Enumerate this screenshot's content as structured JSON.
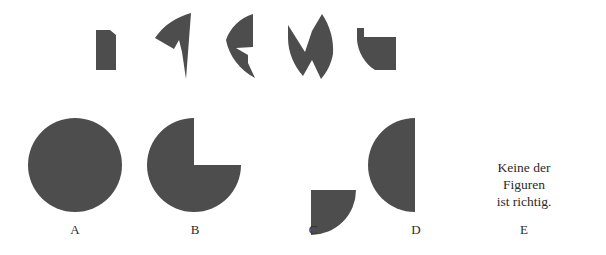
{
  "puzzle": {
    "type": "shape-assembly-visual-reasoning",
    "language": "de",
    "background_color": "#ffffff",
    "shape_fill_color": "#4d4d4d",
    "label_color": "#2b2b2b"
  },
  "fragments": {
    "caption": "",
    "count": 5,
    "items": [
      {
        "id": "fragment-1",
        "name": "notched-rectangle-piece"
      },
      {
        "id": "fragment-2",
        "name": "curved-arrow-wedge-piece"
      },
      {
        "id": "fragment-3",
        "name": "crescent-notch-piece"
      },
      {
        "id": "fragment-4",
        "name": "zigzag-double-wedge-piece"
      },
      {
        "id": "fragment-5",
        "name": "quarter-round-notched-piece"
      }
    ]
  },
  "options": {
    "count": 5,
    "items": [
      {
        "label": "A",
        "name": "full-circle",
        "description": "full circle"
      },
      {
        "label": "B",
        "name": "three-quarter-circle",
        "description": "circle with upper-right quarter removed"
      },
      {
        "label": "C",
        "name": "quarter-circle",
        "description": "quarter disc"
      },
      {
        "label": "D",
        "name": "half-circle",
        "description": "semicircle with flat edge on the right"
      },
      {
        "label": "E",
        "name": "none-of-the-figures",
        "description": "none of the figures is correct"
      }
    ]
  },
  "option_e_text": {
    "line1": "Keine der",
    "line2": "Figuren",
    "line3": "ist richtig."
  }
}
